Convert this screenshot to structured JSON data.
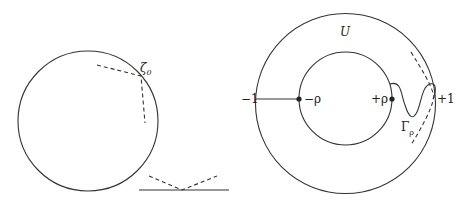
{
  "left_figure": {
    "point_label": "ζ",
    "point_subscript": "0"
  },
  "right_figure": {
    "region_label": "U",
    "labels": {
      "minus_one": "−1",
      "minus_rho": "−ρ",
      "plus_rho": "+ρ",
      "plus_one": "+1",
      "curve": "Γ",
      "curve_subscript": "ρ"
    }
  },
  "colors": {
    "stroke": "#333333",
    "text": "#222222",
    "background": "#ffffff"
  }
}
